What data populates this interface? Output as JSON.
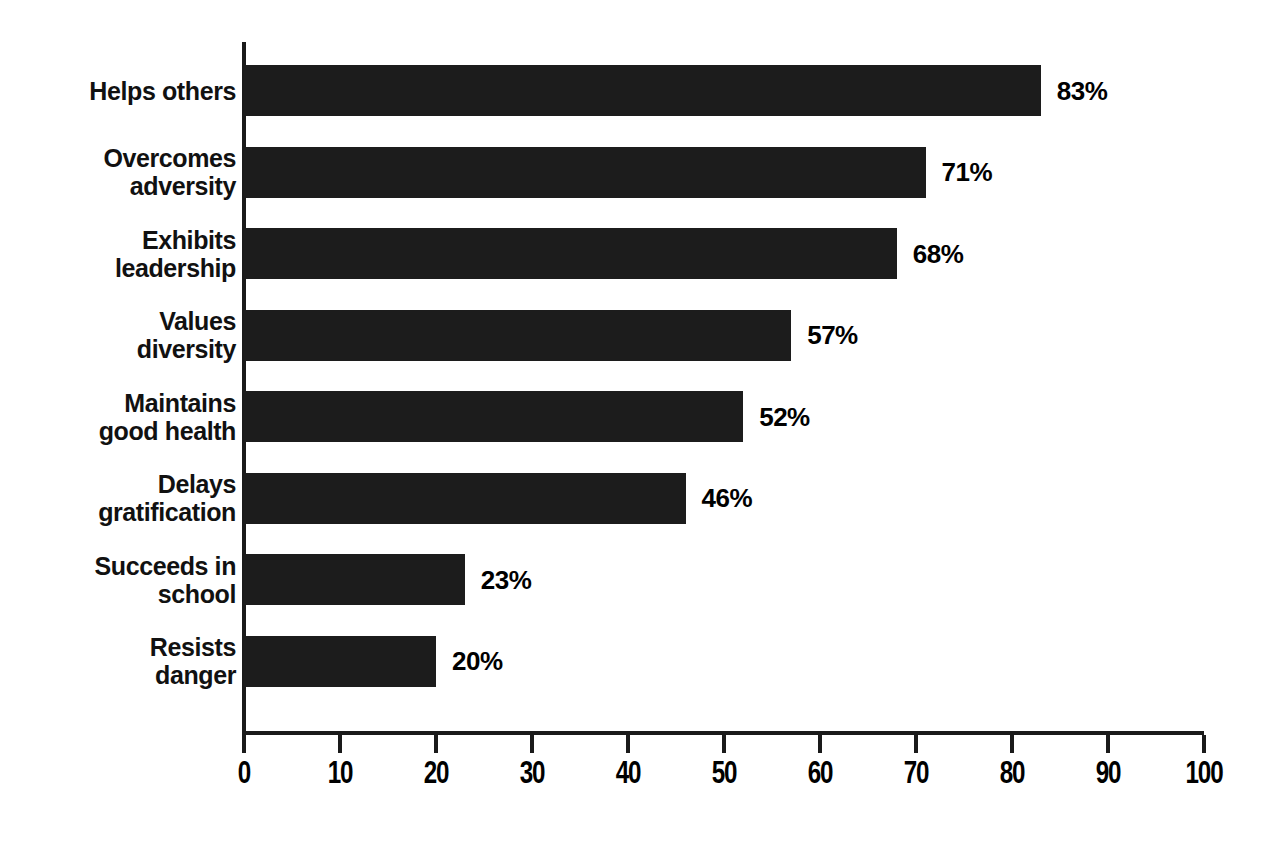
{
  "chart_data": {
    "type": "bar",
    "orientation": "horizontal",
    "title": "",
    "subtitle": "",
    "xlabel": "",
    "ylabel": "",
    "xlim": [
      0,
      100
    ],
    "ylim": null,
    "grid": false,
    "legend": null,
    "bar_color": "#1c1c1c",
    "axis_color": "#1a1a1a",
    "value_suffix": "%",
    "xticks": [
      0,
      10,
      20,
      30,
      40,
      50,
      60,
      70,
      80,
      90,
      100
    ],
    "xtick_labels": [
      "0",
      "10",
      "20",
      "30",
      "40",
      "50",
      "60",
      "70",
      "80",
      "90",
      "100"
    ],
    "categories": [
      "Helps others",
      "Overcomes\nadversity",
      "Exhibits\nleadership",
      "Values\ndiversity",
      "Maintains\ngood health",
      "Delays\ngratification",
      "Succeeds in\nschool",
      "Resists\ndanger"
    ],
    "values": [
      83,
      71,
      68,
      57,
      52,
      46,
      23,
      20
    ],
    "data_labels": [
      "83%",
      "71%",
      "68%",
      "57%",
      "52%",
      "46%",
      "23%",
      "20%"
    ]
  }
}
